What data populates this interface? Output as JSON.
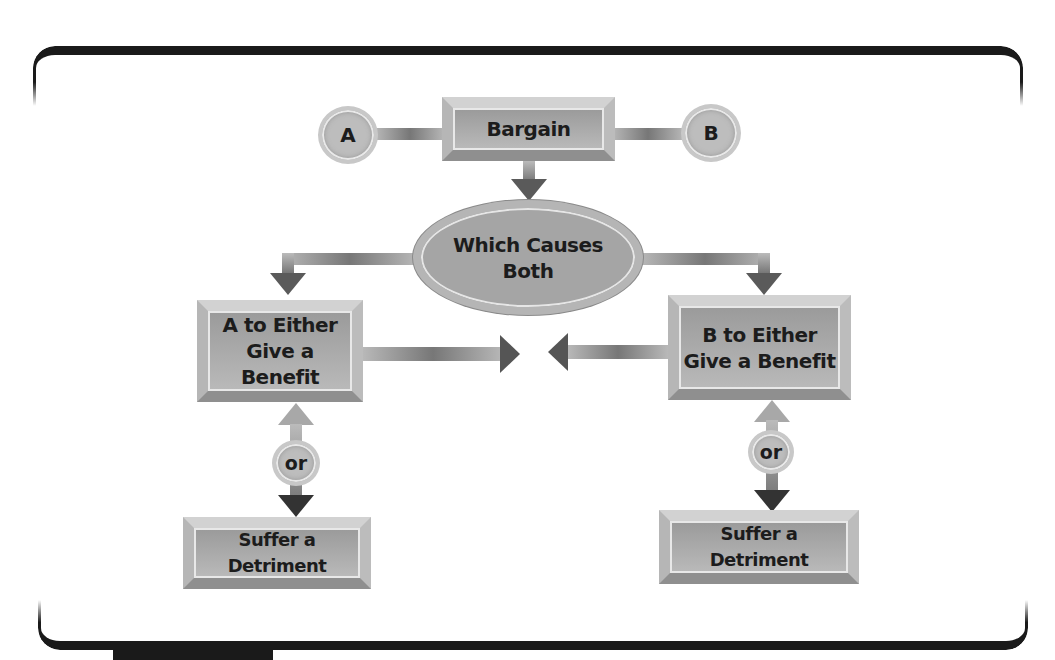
{
  "diagram": {
    "nodes": {
      "party_a": "A",
      "party_b": "B",
      "bargain": "Bargain",
      "causes": "Which Causes Both",
      "causes_line1": "Which Causes",
      "causes_line2": "Both",
      "a_benefit_line1": "A to Either",
      "a_benefit_line2": "Give a Benefit",
      "b_benefit_line1": "B to Either",
      "b_benefit_line2": "Give a Benefit",
      "or_left": "or",
      "or_right": "or",
      "a_detriment": "Suffer a Detriment",
      "b_detriment": "Suffer a Detriment"
    },
    "edges": [
      {
        "from": "A",
        "to": "Bargain"
      },
      {
        "from": "B",
        "to": "Bargain"
      },
      {
        "from": "Bargain",
        "to": "Which Causes Both"
      },
      {
        "from": "Which Causes Both",
        "to": "A to Either Give a Benefit"
      },
      {
        "from": "Which Causes Both",
        "to": "B to Either Give a Benefit"
      },
      {
        "from": "A to Either Give a Benefit",
        "to": "center"
      },
      {
        "from": "B to Either Give a Benefit",
        "to": "center"
      },
      {
        "from": "A to Either Give a Benefit",
        "to": "Suffer a Detriment",
        "label": "or"
      },
      {
        "from": "B to Either Give a Benefit",
        "to": "Suffer a Detriment",
        "label": "or"
      }
    ],
    "colors": {
      "frame": "#1a1a1a",
      "node_fill": "#a6a6a6",
      "text": "#1c1c1c",
      "arrow": "#555555"
    }
  }
}
